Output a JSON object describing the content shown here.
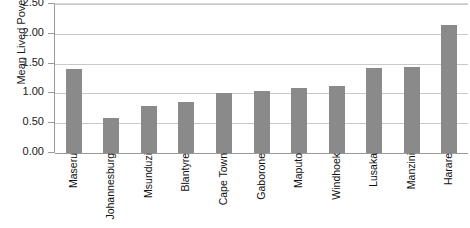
{
  "chart_data": {
    "type": "bar",
    "title": "",
    "xlabel": "",
    "ylabel": "Mean Lived Poverty Index",
    "ylim": [
      0,
      2.5
    ],
    "ytick_values": [
      0,
      0.5,
      1.0,
      1.5,
      2.0,
      2.5
    ],
    "ytick_labels": [
      "0.00",
      "0.50",
      "1.00",
      "1.50",
      "2.00",
      "2.50"
    ],
    "grid": true,
    "legend": "none",
    "bar_color": "#8a8a8a",
    "categories": [
      "Maseru",
      "Johannesburg",
      "Msunduzi",
      "Blantyre",
      "Cape Town",
      "Gaborone",
      "Maputo",
      "Windhoek",
      "Lusaka",
      "Manzini",
      "Harare"
    ],
    "values": [
      1.41,
      0.59,
      0.79,
      0.86,
      1.0,
      1.04,
      1.09,
      1.13,
      1.43,
      1.45,
      2.14
    ]
  }
}
